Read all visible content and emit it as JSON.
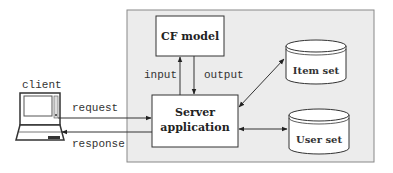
{
  "diagram": {
    "title": "",
    "client": {
      "label": "client",
      "icon": "laptop-icon"
    },
    "server_container": {
      "fill": "#ececec",
      "stroke": "#888888"
    },
    "nodes": {
      "cf_model": {
        "label": "CF model"
      },
      "server_app": {
        "line1": "Server",
        "line2": "application"
      },
      "item_set": {
        "label": "Item set",
        "shape": "database-cylinder"
      },
      "user_set": {
        "label": "User set",
        "shape": "database-cylinder"
      }
    },
    "edges": {
      "request": {
        "label": "request",
        "from": "client",
        "to": "server_app"
      },
      "response": {
        "label": "response",
        "from": "server_app",
        "to": "client"
      },
      "input": {
        "label": "input",
        "from": "server_app",
        "to": "cf_model"
      },
      "output": {
        "label": "output",
        "from": "cf_model",
        "to": "server_app"
      },
      "item_link": {
        "label": "",
        "from": "server_app",
        "to": "item_set",
        "bidirectional": true
      },
      "user_link": {
        "label": "",
        "from": "server_app",
        "to": "user_set",
        "bidirectional": true
      }
    }
  }
}
